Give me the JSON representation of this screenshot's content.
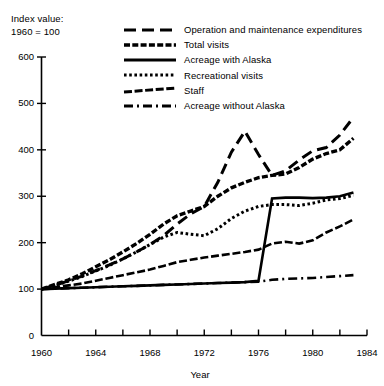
{
  "chart_data": {
    "type": "line",
    "title": "",
    "subtitle": "",
    "note": "Index value:\n1960 = 100",
    "xlabel": "Year",
    "ylabel": "",
    "xlim": [
      1960,
      1984
    ],
    "ylim": [
      0,
      600
    ],
    "grid": false,
    "legend_position": "top-right",
    "xticks": [
      1960,
      1962,
      1964,
      1966,
      1968,
      1970,
      1972,
      1974,
      1976,
      1978,
      1980,
      1982,
      1984
    ],
    "xtick_labels": [
      "1960",
      "",
      "1964",
      "",
      "1968",
      "",
      "1972",
      "",
      "1976",
      "",
      "1980",
      "",
      "1984"
    ],
    "yticks": [
      0,
      100,
      200,
      300,
      400,
      500,
      600
    ],
    "ytick_labels": [
      "0",
      "100",
      "200",
      "300",
      "400",
      "500",
      "600"
    ],
    "x": [
      1960,
      1961,
      1962,
      1963,
      1964,
      1965,
      1966,
      1967,
      1968,
      1969,
      1970,
      1971,
      1972,
      1973,
      1974,
      1975,
      1976,
      1977,
      1978,
      1979,
      1980,
      1981,
      1982,
      1983
    ],
    "series": [
      {
        "name": "Operation and maintenance expenditures",
        "style": "long-dash",
        "values": [
          100,
          108,
          118,
          128,
          140,
          152,
          165,
          180,
          196,
          215,
          240,
          262,
          278,
          330,
          395,
          440,
          390,
          345,
          355,
          378,
          398,
          405,
          432,
          470
        ]
      },
      {
        "name": "Total visits",
        "style": "dash-heavy",
        "values": [
          100,
          110,
          120,
          133,
          148,
          163,
          180,
          198,
          218,
          240,
          258,
          268,
          278,
          300,
          318,
          330,
          340,
          345,
          348,
          362,
          380,
          392,
          400,
          425
        ]
      },
      {
        "name": "Acreage with Alaska",
        "style": "solid",
        "values": [
          100,
          101,
          102,
          103,
          104,
          105,
          106,
          107,
          108,
          109,
          110,
          111,
          112,
          113,
          114,
          115,
          118,
          295,
          297,
          297,
          296,
          297,
          300,
          308
        ]
      },
      {
        "name": "Recreational visits",
        "style": "dotted",
        "values": [
          100,
          108,
          117,
          127,
          139,
          151,
          165,
          180,
          196,
          212,
          222,
          218,
          215,
          230,
          252,
          268,
          278,
          282,
          282,
          280,
          285,
          292,
          295,
          302
        ]
      },
      {
        "name": "Staff",
        "style": "short-dash",
        "values": [
          100,
          104,
          108,
          112,
          118,
          124,
          130,
          136,
          142,
          150,
          158,
          163,
          168,
          172,
          176,
          180,
          185,
          198,
          202,
          198,
          205,
          222,
          235,
          250
        ]
      },
      {
        "name": "Acreage without Alaska",
        "style": "dash-dot",
        "values": [
          100,
          101,
          102,
          103,
          104,
          105,
          106,
          107,
          108,
          109,
          110,
          111,
          112,
          113,
          114,
          115,
          116,
          120,
          122,
          123,
          124,
          126,
          128,
          130
        ]
      }
    ]
  },
  "axis": {
    "y_labels": [
      "600",
      "500",
      "400",
      "300",
      "200",
      "100",
      "0"
    ],
    "x_labels": [
      "1960",
      "1964",
      "1968",
      "1972",
      "1976",
      "1980",
      "1984"
    ],
    "x_title": "Year"
  },
  "note_lines": [
    "Index value:",
    "1960 = 100"
  ],
  "legend": {
    "items": [
      {
        "label": "Operation and maintenance expenditures",
        "style": "long-dash"
      },
      {
        "label": "Total visits",
        "style": "dash-heavy"
      },
      {
        "label": "Acreage with Alaska",
        "style": "solid"
      },
      {
        "label": "Recreational visits",
        "style": "dotted"
      },
      {
        "label": "Staff",
        "style": "short-dash"
      },
      {
        "label": "Acreage without Alaska",
        "style": "dash-dot"
      }
    ]
  },
  "colors": {
    "ink": "#000000",
    "background": "#ffffff"
  }
}
